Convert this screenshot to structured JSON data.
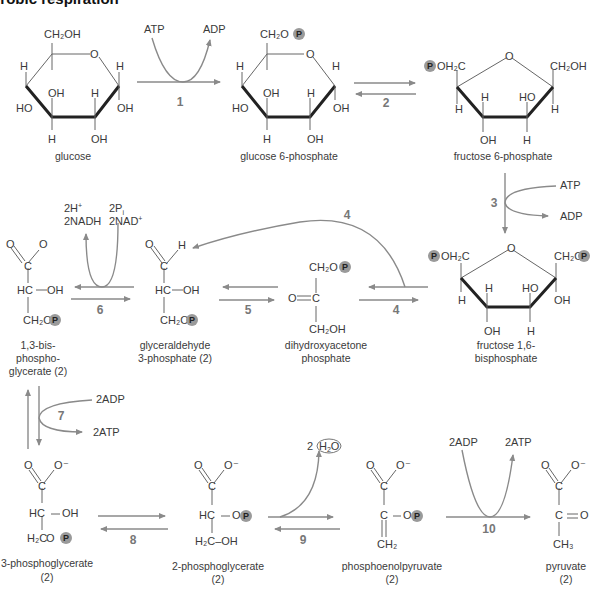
{
  "title_visible": "erobic respiration",
  "colors": {
    "arrow": "#8a8a8a",
    "bond": "#666666",
    "phosphate": "#9a9a9a",
    "text": "#3a3a3a"
  },
  "compounds": {
    "glucose": {
      "label": "glucose"
    },
    "g6p": {
      "label": "glucose 6-phosphate"
    },
    "f6p": {
      "label": "fructose 6-phosphate"
    },
    "f16bp": {
      "label1": "fructose 1,6-",
      "label2": "bisphosphate"
    },
    "dhap": {
      "label1": "dihydroxyacetone",
      "label2": "phosphate"
    },
    "g3p": {
      "label1": "glyceraldehyde",
      "label2": "3-phosphate (2)"
    },
    "bpg": {
      "label1": "1,3-bis-",
      "label2": "phospho-",
      "label3": "glycerate (2)"
    },
    "pg3": {
      "label1": "3-phosphoglycerate",
      "label2": "(2)"
    },
    "pg2": {
      "label1": "2-phosphoglycerate",
      "label2": "(2)"
    },
    "pep": {
      "label1": "phosphoenolpyruvate",
      "label2": "(2)"
    },
    "pyruvate": {
      "label1": "pyruvate",
      "label2": "(2)"
    }
  },
  "steps": [
    {
      "n": "1",
      "in": "ATP",
      "out": "ADP"
    },
    {
      "n": "2"
    },
    {
      "n": "3",
      "in": "ATP",
      "out": "ADP"
    },
    {
      "n": "4"
    },
    {
      "n": "5"
    },
    {
      "n": "6",
      "in1": "2P",
      "in1_sub": "i",
      "in2": "2NAD",
      "in2_sup": "+",
      "out1": "2H",
      "out1_sup": "+",
      "out2": "2NADH"
    },
    {
      "n": "7",
      "in": "2ADP",
      "out": "2ATP"
    },
    {
      "n": "8"
    },
    {
      "n": "9",
      "out_coef": "2",
      "out": "H2O"
    },
    {
      "n": "10",
      "in": "2ADP",
      "out": "2ATP"
    }
  ],
  "atoms": {
    "P": "P",
    "O": "O",
    "H": "H",
    "OH": "OH",
    "HO": "HO",
    "C": "C",
    "HC": "HC",
    "CH2OH": "CH₂OH",
    "CH2O": "CH₂O",
    "POH2C": "OH₂C",
    "CH2": "CH₂",
    "CH3": "CH₃",
    "H2C": "H₂C",
    "O_minus": "O⁻",
    "O_dbl_C": "O═C",
    "C_dbl_O": "C═O",
    "H2C_OH": "H₂C–OH"
  }
}
